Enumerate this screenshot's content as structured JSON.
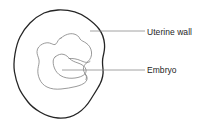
{
  "figure": {
    "type": "anatomical-line-diagram",
    "background_color": "#ffffff"
  },
  "labels": [
    {
      "id": "uterine-wall",
      "text": "Uterine wall",
      "leader_line": "horizontal line from the uterine wall outline to the label",
      "x": 147,
      "y": 27
    },
    {
      "id": "embryo",
      "text": "Embryo",
      "leader_line": "horizontal line from the embryo outline to the label",
      "x": 147,
      "y": 65
    }
  ],
  "shapes": [
    {
      "id": "uterine-wall-outline",
      "name": "uterine wall",
      "stroke": "#252525",
      "stroke_width": 1.3,
      "fill": "none",
      "description": "large irregular closed contour forming the outer boundary"
    },
    {
      "id": "gestational-sac-outline",
      "name": "gestational sac",
      "stroke": "#808080",
      "stroke_width": 0.8,
      "fill": "none",
      "description": "inner lobed contour within the uterine wall"
    },
    {
      "id": "embryo-outline",
      "name": "embryo",
      "stroke": "#808080",
      "stroke_width": 0.8,
      "fill": "none",
      "description": "small teardrop shaped contour at the centre"
    }
  ],
  "colors": {
    "outer_stroke": "#252525",
    "inner_stroke": "#808080",
    "leader_stroke": "#8c8c8c",
    "text": "#242424",
    "background": "#ffffff"
  }
}
